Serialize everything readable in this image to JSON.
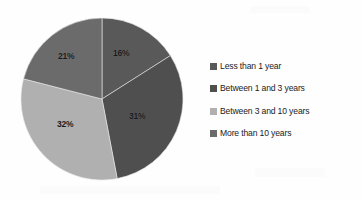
{
  "chart_data": {
    "type": "pie",
    "title": "",
    "xlabel": "",
    "ylabel": "",
    "legend_position": "right",
    "grid": false,
    "categories": [
      "Less than 1 year",
      "Between 1 and 3 years",
      "Between 3 and 10 years",
      "More than 10 years"
    ],
    "values": [
      16,
      31,
      32,
      21
    ],
    "value_labels": [
      "16%",
      "31%",
      "32%",
      "21%"
    ],
    "colors": [
      "#595959",
      "#4f4f4f",
      "#b0b0b0",
      "#6b6b6b"
    ],
    "start_angle_deg": 0,
    "direction": "clockwise",
    "slices": [
      {
        "label": "Less than 1 year",
        "value": 16,
        "value_label": "16%",
        "color": "#595959",
        "start_deg": 0,
        "end_deg": 57.6
      },
      {
        "label": "Between 1 and 3 years",
        "value": 31,
        "value_label": "31%",
        "color": "#4f4f4f",
        "start_deg": 57.6,
        "end_deg": 169.2
      },
      {
        "label": "Between 3 and 10 years",
        "value": 32,
        "value_label": "32%",
        "color": "#b0b0b0",
        "start_deg": 169.2,
        "end_deg": 284.4
      },
      {
        "label": "More than 10 years",
        "value": 21,
        "value_label": "21%",
        "color": "#6b6b6b",
        "start_deg": 284.4,
        "end_deg": 360
      }
    ]
  },
  "legend": {
    "items": [
      {
        "label": "Less than 1 year",
        "color": "#595959"
      },
      {
        "label": "Between 1 and 3 years",
        "color": "#4f4f4f"
      },
      {
        "label": "Between 3 and 10 years",
        "color": "#b0b0b0"
      },
      {
        "label": "More than 10 years",
        "color": "#6b6b6b"
      }
    ]
  },
  "geometry": {
    "center_x": 102,
    "center_y": 99,
    "radius": 81
  },
  "labels": {
    "slice_0": {
      "text": "16%",
      "x": 113,
      "y": 49
    },
    "slice_1": {
      "text": "31%",
      "x": 129,
      "y": 112
    },
    "slice_2": {
      "text": "32%",
      "x": 57,
      "y": 120
    },
    "slice_3": {
      "text": "21%",
      "x": 58,
      "y": 52
    }
  }
}
